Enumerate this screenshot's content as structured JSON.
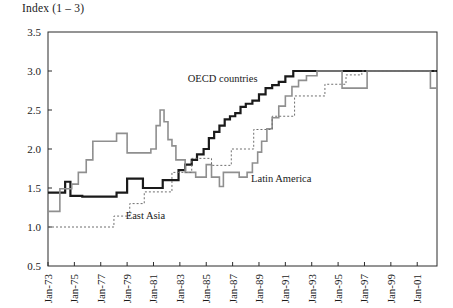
{
  "chart_data": {
    "type": "line",
    "title": "Index (1 – 3)",
    "xlabel": "",
    "ylabel": "",
    "ylim": [
      0.5,
      3.5
    ],
    "ytick_labels": [
      "3.5",
      "3.0",
      "2.5",
      "2.0",
      "1.5",
      "1.0",
      "0.5"
    ],
    "ytick_values": [
      3.5,
      3.0,
      2.5,
      2.0,
      1.5,
      1.0,
      0.5
    ],
    "grid": false,
    "legend_position": "inline-annotations",
    "xtick_labels": [
      "Jan-73",
      "Jan-75",
      "Jan-77",
      "Jan-79",
      "Jan-81",
      "Jan-83",
      "Jan-85",
      "Jan-87",
      "Jan-89",
      "Jan-91",
      "Jan-93",
      "Jan-95",
      "Jan-97",
      "Jan-99",
      "Jan-01"
    ],
    "xtick_values": [
      1973,
      1975,
      1977,
      1979,
      1981,
      1983,
      1985,
      1987,
      1989,
      1991,
      1993,
      1995,
      1997,
      1999,
      2001
    ],
    "xlim": [
      1973,
      2002.5
    ],
    "step_style": "post",
    "series": [
      {
        "name": "OECD countries",
        "color": "#1a1a1a",
        "width": 2.2,
        "dash": "none",
        "label_x": 1983.6,
        "label_y": 2.86,
        "x": [
          1973.0,
          1973.9,
          1974.3,
          1974.7,
          1975.1,
          1975.6,
          1976.2,
          1977.3,
          1978.2,
          1979.0,
          1979.6,
          1980.2,
          1980.7,
          1981.2,
          1981.7,
          1982.3,
          1982.9,
          1983.4,
          1983.9,
          1984.3,
          1984.8,
          1985.2,
          1985.6,
          1986.0,
          1986.4,
          1986.8,
          1987.2,
          1987.6,
          1988.0,
          1988.5,
          1989.0,
          1989.5,
          1990.0,
          1990.5,
          1991.0,
          1991.6,
          1992.3,
          2002.5
        ],
        "y": [
          1.44,
          1.44,
          1.58,
          1.4,
          1.4,
          1.39,
          1.39,
          1.39,
          1.44,
          1.62,
          1.62,
          1.5,
          1.5,
          1.5,
          1.6,
          1.6,
          1.73,
          1.8,
          1.86,
          1.93,
          2.0,
          2.14,
          2.22,
          2.3,
          2.38,
          2.42,
          2.46,
          2.54,
          2.58,
          2.62,
          2.7,
          2.78,
          2.82,
          2.86,
          2.93,
          3.0,
          3.0,
          3.0
        ]
      },
      {
        "name": "Latin America",
        "color": "#8f8f8f",
        "width": 1.6,
        "dash": "none",
        "label_x": 1988.4,
        "label_y": 1.58,
        "x": [
          1973.0,
          1973.4,
          1973.9,
          1974.3,
          1974.8,
          1975.3,
          1975.9,
          1976.4,
          1977.2,
          1978.2,
          1979.0,
          1979.6,
          1980.2,
          1980.8,
          1981.2,
          1981.5,
          1981.8,
          1982.1,
          1982.4,
          1982.7,
          1983.0,
          1983.4,
          1983.8,
          1984.2,
          1984.6,
          1985.0,
          1985.4,
          1985.7,
          1986.0,
          1986.3,
          1986.6,
          1986.9,
          1987.2,
          1987.5,
          1987.8,
          1988.1,
          1988.5,
          1988.9,
          1989.2,
          1989.6,
          1990.0,
          1990.5,
          1991.0,
          1991.5,
          1992.0,
          1992.6,
          1993.4,
          1994.6,
          1995.3,
          1996.5,
          1997.2,
          2001.3,
          2002.0,
          2002.5
        ],
        "y": [
          1.2,
          1.2,
          1.49,
          1.49,
          1.55,
          1.7,
          1.86,
          2.1,
          2.1,
          2.2,
          1.95,
          1.95,
          1.95,
          2.0,
          2.3,
          2.5,
          2.35,
          2.12,
          2.04,
          1.86,
          1.86,
          1.7,
          1.7,
          1.64,
          1.64,
          1.8,
          1.64,
          1.64,
          1.52,
          1.7,
          1.7,
          1.7,
          1.7,
          1.64,
          1.64,
          1.7,
          1.82,
          1.96,
          2.1,
          2.26,
          2.4,
          2.55,
          2.68,
          2.8,
          2.88,
          2.94,
          3.0,
          3.0,
          2.78,
          2.78,
          3.0,
          3.0,
          2.78,
          2.78
        ]
      },
      {
        "name": "East Asia",
        "color": "#6f6f6f",
        "width": 1.0,
        "dash": "2 2",
        "label_x": 1978.9,
        "label_y": 1.1,
        "x": [
          1973.0,
          1977.8,
          1978.0,
          1978.9,
          1979.2,
          1980.0,
          1980.3,
          1982.0,
          1982.4,
          1983.6,
          1983.9,
          1985.0,
          1985.4,
          1986.6,
          1986.9,
          1988.2,
          1988.6,
          1989.6,
          1990.0,
          1991.3,
          1991.7,
          1993.5,
          1994.0,
          1995.2,
          1995.6,
          1996.4,
          1996.8,
          2002.5
        ],
        "y": [
          1.0,
          1.0,
          1.14,
          1.14,
          1.3,
          1.3,
          1.45,
          1.45,
          1.7,
          1.7,
          1.88,
          1.88,
          1.79,
          1.79,
          2.0,
          2.0,
          2.25,
          2.25,
          2.42,
          2.42,
          2.68,
          2.68,
          2.83,
          2.83,
          2.95,
          2.95,
          3.0,
          3.0
        ]
      }
    ]
  }
}
